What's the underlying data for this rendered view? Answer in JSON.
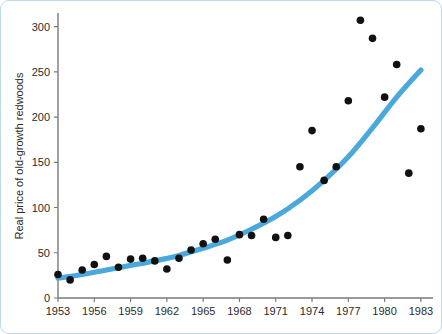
{
  "chart_data": {
    "type": "scatter",
    "title": "",
    "xlabel": "",
    "ylabel": "Real price of old-growth redwoods",
    "xlim": [
      1953,
      1984
    ],
    "ylim": [
      0,
      315
    ],
    "grid": false,
    "legend": "none",
    "x_ticks": [
      "1953",
      "1956",
      "1959",
      "1962",
      "1965",
      "1968",
      "1971",
      "1974",
      "1977",
      "1980",
      "1983"
    ],
    "x_tick_values": [
      1953,
      1956,
      1959,
      1962,
      1965,
      1968,
      1971,
      1974,
      1977,
      1980,
      1983
    ],
    "y_ticks": [
      "0",
      "50",
      "100",
      "150",
      "200",
      "250",
      "300"
    ],
    "y_tick_values": [
      0,
      50,
      100,
      150,
      200,
      250,
      300
    ],
    "point_color": "#111111",
    "trend_color": "#4aa8dd",
    "axis_color": "#7a7a7a",
    "series": [
      {
        "name": "Real price of old-growth redwoods",
        "type": "scatter",
        "x": [
          1953,
          1954,
          1955,
          1956,
          1957,
          1958,
          1959,
          1960,
          1961,
          1962,
          1963,
          1964,
          1965,
          1966,
          1967,
          1968,
          1969,
          1970,
          1971,
          1972,
          1973,
          1974,
          1975,
          1976,
          1977,
          1978,
          1979,
          1980,
          1981,
          1982,
          1983
        ],
        "y": [
          26,
          20,
          31,
          37,
          46,
          34,
          43,
          44,
          41,
          32,
          44,
          53,
          60,
          65,
          42,
          70,
          69,
          87,
          67,
          69,
          145,
          185,
          130,
          145,
          218,
          307,
          287,
          222,
          258,
          138,
          187
        ]
      },
      {
        "name": "fitted exponential trend",
        "type": "line",
        "x": [
          1953,
          1955,
          1957,
          1959,
          1961,
          1963,
          1965,
          1967,
          1969,
          1971,
          1973,
          1975,
          1977,
          1979,
          1981,
          1983
        ],
        "y": [
          22,
          26,
          31,
          36,
          41,
          47,
          55,
          64,
          76,
          90,
          108,
          130,
          156,
          188,
          222,
          252
        ]
      }
    ]
  }
}
